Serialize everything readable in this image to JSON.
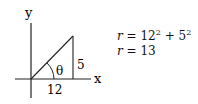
{
  "diagram": {
    "axis_labels": {
      "x": "x",
      "y": "y"
    },
    "angle_label": "θ",
    "sides": {
      "adjacent": "12",
      "opposite": "5"
    },
    "equations": [
      {
        "lhs": "r",
        "rhs_base1": "12",
        "rhs_exp1": "2",
        "op": "+",
        "rhs_base2": "5",
        "rhs_exp2": "2"
      },
      {
        "lhs": "r",
        "rhs": "13"
      }
    ]
  }
}
